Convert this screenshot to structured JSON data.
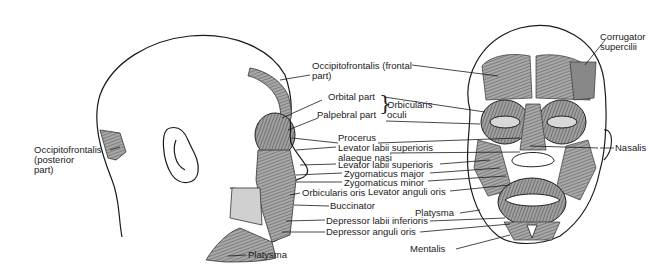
{
  "figure": {
    "left_view": "lateral",
    "right_view": "anterior"
  },
  "labels": {
    "occipitofrontalis_posterior": [
      "Occipitofrontalis",
      "(posterior",
      "part)"
    ],
    "occipitofrontalis_frontal": [
      "Occipitofrontalis (frontal",
      "part)"
    ],
    "orbital_part": "Orbital part",
    "palpebral_part": "Palpebral part",
    "orbicularis_oculi": [
      "Orbicularis",
      "oculi"
    ],
    "procerus": "Procerus",
    "levator_labii_sup_alaeque": [
      "Levator labii superioris",
      "alaeque nasi"
    ],
    "levator_labii_sup": "Levator labii superioris",
    "zygomaticus_major": "Zygomaticus major",
    "zygomaticus_minor": "Zygomaticus minor",
    "orbicularis_oris": "Orbicularis oris",
    "levator_anguli_oris": "Levator anguli oris",
    "buccinator": "Buccinator",
    "platysma_front": "Platysma",
    "depressor_labii_inferioris": "Depressor labii inferioris",
    "depressor_anguli_oris": "Depressor anguli oris",
    "platysma_side": "Platysma",
    "mentalis": "Mentalis",
    "corrugator_supercilii": [
      "Corrugator",
      "supercilii"
    ],
    "nasalis": "Nasalis"
  },
  "colors": {
    "ink": "#1a1a1a",
    "muscle_fill": "#9a9a9a",
    "muscle_dark": "#5a5a5a",
    "background": "#ffffff"
  }
}
